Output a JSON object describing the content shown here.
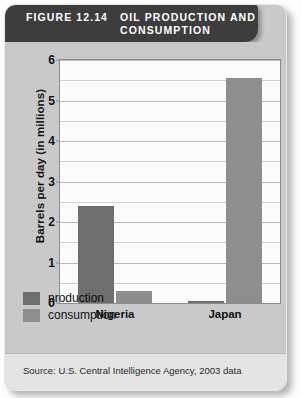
{
  "figure": {
    "number_label": "FIGURE 12.14",
    "title": "OIL PRODUCTION AND CONSUMPTION",
    "source": "Source: U.S. Central Intelligence Agency, 2003 data"
  },
  "colors": {
    "banner_background": "#3d3d3d",
    "banner_text": "#ffffff",
    "card_background": "#c9c9c9",
    "plot_background": "#fbfbfb",
    "production": "#6e6e6e",
    "consumption": "#8e8e8e",
    "gridline": "#cfcfcf",
    "source_background": "#e4e4e4"
  },
  "chart_data": {
    "type": "bar",
    "title": "OIL PRODUCTION AND CONSUMPTION",
    "xlabel": "",
    "ylabel": "Barrels per day (in millions)",
    "categories": [
      "Nigeria",
      "Japan"
    ],
    "series": [
      {
        "name": "production",
        "values": [
          2.4,
          0.05
        ],
        "color": "#6e6e6e"
      },
      {
        "name": "consumption",
        "values": [
          0.3,
          5.55
        ],
        "color": "#8e8e8e"
      }
    ],
    "ylim": [
      0,
      6
    ],
    "ytick_labels": [
      "0",
      "1",
      "2",
      "3",
      "4",
      "5",
      "6"
    ],
    "ytick_values": [
      0,
      1,
      2,
      3,
      4,
      5,
      6
    ],
    "gridline_values": [
      0.5,
      1,
      1.5,
      2,
      2.5,
      3,
      3.5,
      4,
      4.5,
      5,
      5.5,
      6
    ],
    "grid": true,
    "legend_position": "below-left",
    "legend_entries": [
      "production",
      "consumption"
    ]
  }
}
